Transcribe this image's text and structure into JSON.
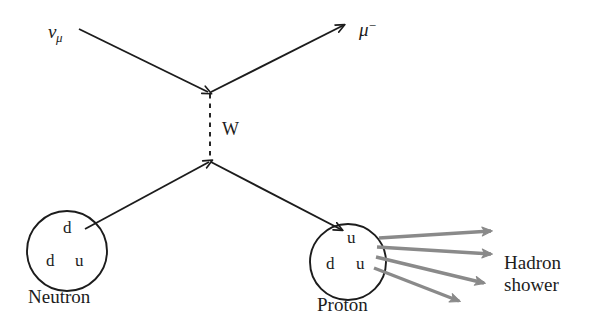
{
  "diagram": {
    "colors": {
      "ink": "#1c1c1c",
      "shower_gray": "#8a8a8a",
      "background": "#ffffff"
    },
    "incoming_lepton": {
      "symbol": "ν",
      "subscript": "μ",
      "name": "muon-neutrino"
    },
    "outgoing_lepton": {
      "symbol": "μ",
      "superscript": "−",
      "name": "muon"
    },
    "boson": {
      "label": "W",
      "name": "w-boson",
      "style": "dashed"
    },
    "neutron": {
      "name": "Neutron",
      "quarks": [
        {
          "label": "d"
        },
        {
          "label": "d"
        },
        {
          "label": "u"
        }
      ]
    },
    "proton": {
      "name": "Proton",
      "quarks": [
        {
          "label": "u"
        },
        {
          "label": "d"
        },
        {
          "label": "u"
        }
      ]
    },
    "shower": {
      "line1": "Hadron",
      "line2": "shower",
      "arrow_count": 4
    }
  }
}
